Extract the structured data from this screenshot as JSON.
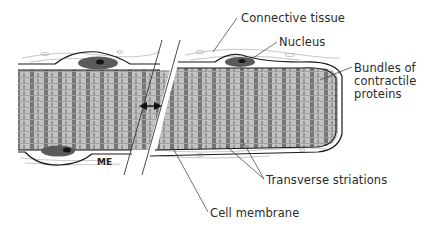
{
  "labels": {
    "connective_tissue": "Connective tissue",
    "nucleus": "Nucleus",
    "bundles": "Bundles of\ncontractile\nproteins",
    "transverse_striations": "Transverse striations",
    "cell_membrane": "Cell membrane"
  },
  "signature": "ME",
  "colors": {
    "fiber_fill": "#bdbdbd",
    "striation_dark": "#4a4a4a",
    "outline": "#1a1a1a",
    "nucleus_fill": "#5a5a5a",
    "nucleus_core": "#151515",
    "leader_line": "#333333",
    "connective": "#9a9a9a"
  }
}
